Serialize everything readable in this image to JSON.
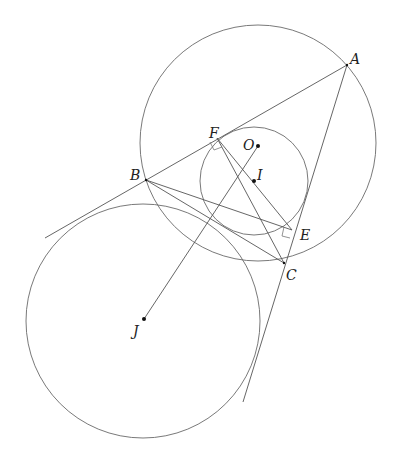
{
  "diagram": {
    "type": "geometry",
    "points": {
      "A": {
        "label": "A",
        "x": 347,
        "y": 65
      },
      "B": {
        "label": "B",
        "x": 146,
        "y": 180
      },
      "C": {
        "label": "C",
        "x": 284,
        "y": 263
      },
      "E": {
        "label": "E",
        "x": 292,
        "y": 230
      },
      "F": {
        "label": "F",
        "x": 217,
        "y": 138
      },
      "O": {
        "label": "O",
        "x": 258,
        "y": 146
      },
      "I": {
        "label": "I",
        "x": 254,
        "y": 181
      },
      "J": {
        "label": "J",
        "x": 144,
        "y": 319
      }
    },
    "circles": [
      {
        "name": "circumcircle",
        "center": "O",
        "cx": 258,
        "cy": 143,
        "r": 118
      },
      {
        "name": "small-circle",
        "center": "I",
        "cx": 254,
        "cy": 181,
        "r": 54
      },
      {
        "name": "excircle",
        "center": "J",
        "cx": 143,
        "cy": 321,
        "r": 117
      }
    ],
    "segments": [
      {
        "name": "line-AB-extended",
        "from": "A",
        "to_xy": [
          45,
          238
        ]
      },
      {
        "name": "line-AC-extended",
        "from": "A",
        "to_xy": [
          243,
          402
        ]
      },
      {
        "name": "segment-BC",
        "from": "B",
        "to": "C"
      },
      {
        "name": "segment-BE",
        "from": "B",
        "to": "E"
      },
      {
        "name": "segment-FC",
        "from": "F",
        "to": "C"
      },
      {
        "name": "segment-FE",
        "from": "F",
        "to": "E"
      },
      {
        "name": "segment-JO",
        "from": "J",
        "to": "O"
      }
    ],
    "right_angles": [
      "F",
      "E"
    ]
  }
}
